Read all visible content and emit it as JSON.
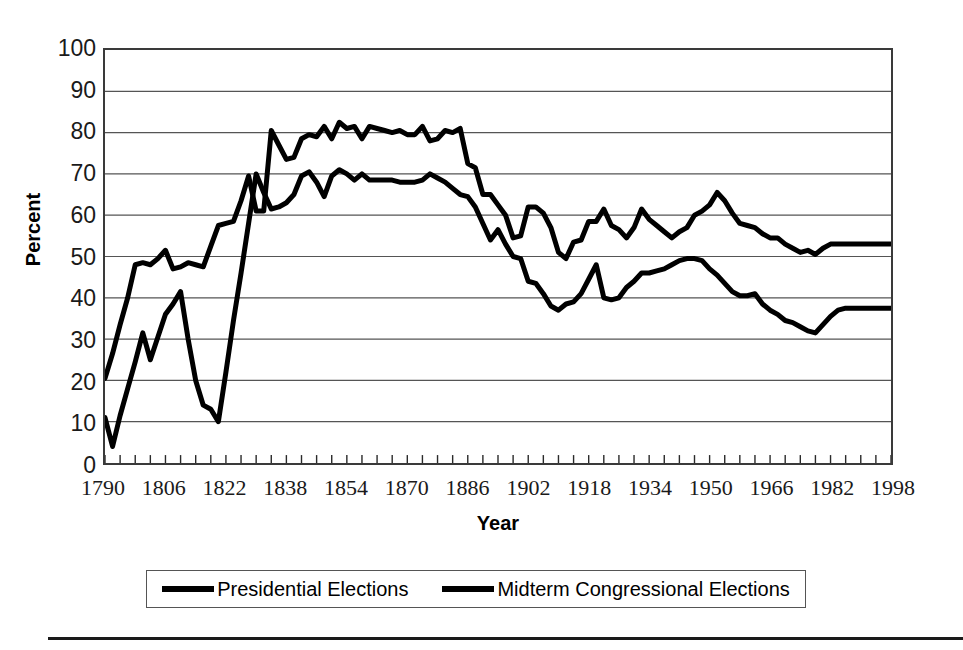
{
  "chart_data": {
    "type": "line",
    "title": "",
    "xlabel": "Year",
    "ylabel": "Percent",
    "xlim": [
      1790,
      1998
    ],
    "ylim": [
      0,
      100
    ],
    "grid": "horizontal",
    "legend_position": "bottom",
    "x_tick_labels": [
      "1790",
      "1806",
      "1822",
      "1838",
      "1854",
      "1870",
      "1886",
      "1902",
      "1918",
      "1934",
      "1950",
      "1966",
      "1982",
      "1998"
    ],
    "x_tick_values": [
      1790,
      1806,
      1822,
      1838,
      1854,
      1870,
      1886,
      1902,
      1918,
      1934,
      1950,
      1966,
      1982,
      1998
    ],
    "x_minor_tick_interval": 4,
    "y_tick_labels": [
      "100",
      "90",
      "80",
      "70",
      "60",
      "50",
      "40",
      "30",
      "20",
      "10",
      "0"
    ],
    "y_tick_values": [
      100,
      90,
      80,
      70,
      60,
      50,
      40,
      30,
      20,
      10,
      0
    ],
    "series": [
      {
        "name": "Presidential Elections",
        "color": "#000000",
        "x": [
          1790,
          1792,
          1794,
          1796,
          1798,
          1800,
          1802,
          1804,
          1806,
          1808,
          1810,
          1812,
          1814,
          1816,
          1818,
          1820,
          1822,
          1824,
          1826,
          1828,
          1830,
          1832,
          1834,
          1836,
          1838,
          1840,
          1842,
          1844,
          1846,
          1848,
          1850,
          1852,
          1854,
          1856,
          1858,
          1860,
          1862,
          1864,
          1866,
          1868,
          1870,
          1872,
          1874,
          1876,
          1878,
          1880,
          1882,
          1884,
          1886,
          1888,
          1890,
          1892,
          1894,
          1896,
          1898,
          1900,
          1902,
          1904,
          1906,
          1908,
          1910,
          1912,
          1914,
          1916,
          1918,
          1920,
          1922,
          1924,
          1926,
          1928,
          1930,
          1932,
          1934,
          1936,
          1938,
          1940,
          1942,
          1944,
          1946,
          1948,
          1950,
          1952,
          1954,
          1956,
          1958,
          1960,
          1962,
          1964,
          1966,
          1968,
          1970,
          1972,
          1974,
          1976,
          1978,
          1980,
          1982,
          1984,
          1986,
          1988,
          1990,
          1992,
          1994,
          1996,
          1998
        ],
        "y": [
          20.5,
          26.5,
          33.5,
          40.0,
          48.0,
          48.5,
          48.0,
          49.5,
          51.5,
          47.0,
          47.5,
          48.5,
          48.0,
          47.5,
          52.5,
          57.5,
          58.0,
          58.5,
          63.5,
          69.5,
          61.0,
          61.0,
          80.5,
          77.0,
          73.5,
          74.0,
          78.5,
          79.5,
          79.0,
          81.5,
          78.5,
          82.5,
          81.0,
          81.5,
          78.5,
          81.5,
          81.0,
          80.5,
          80.0,
          80.5,
          79.5,
          79.5,
          81.5,
          78.0,
          78.5,
          80.5,
          80.0,
          81.0,
          72.5,
          71.5,
          65.0,
          65.0,
          62.5,
          60.0,
          54.5,
          55.0,
          62.0,
          62.0,
          60.5,
          57.0,
          51.0,
          49.5,
          53.5,
          54.0,
          58.5,
          58.5,
          61.5,
          57.5,
          56.5,
          54.5,
          57.0,
          61.5,
          59.0,
          57.5,
          56.0,
          54.5,
          56.0,
          57.0,
          60.0,
          61.0,
          62.5,
          65.5,
          63.5,
          60.5,
          58.0,
          57.5,
          57.0,
          55.5,
          54.5,
          54.5,
          53.0,
          52.0,
          51.0,
          51.5,
          50.5,
          52.0,
          53.0,
          53.0,
          53.0,
          53.0,
          53.0,
          53.0,
          53.0,
          53.0,
          53.0
        ]
      },
      {
        "name": "Midterm Congressional Elections",
        "color": "#000000",
        "x": [
          1790,
          1792,
          1794,
          1796,
          1798,
          1800,
          1802,
          1804,
          1806,
          1808,
          1810,
          1812,
          1814,
          1816,
          1818,
          1820,
          1822,
          1824,
          1826,
          1828,
          1830,
          1832,
          1834,
          1836,
          1838,
          1840,
          1842,
          1844,
          1846,
          1848,
          1850,
          1852,
          1854,
          1856,
          1858,
          1860,
          1862,
          1864,
          1866,
          1868,
          1870,
          1872,
          1874,
          1876,
          1878,
          1880,
          1882,
          1884,
          1886,
          1888,
          1890,
          1892,
          1894,
          1896,
          1898,
          1900,
          1902,
          1904,
          1906,
          1908,
          1910,
          1912,
          1914,
          1916,
          1918,
          1920,
          1922,
          1924,
          1926,
          1928,
          1930,
          1932,
          1934,
          1936,
          1938,
          1940,
          1942,
          1944,
          1946,
          1948,
          1950,
          1952,
          1954,
          1956,
          1958,
          1960,
          1962,
          1964,
          1966,
          1968,
          1970,
          1972,
          1974,
          1976,
          1978,
          1980,
          1982,
          1984,
          1986,
          1988,
          1990,
          1992,
          1994,
          1996,
          1998
        ],
        "y": [
          11.0,
          4.0,
          11.5,
          18.0,
          24.5,
          31.5,
          25.0,
          30.5,
          36.0,
          38.5,
          41.5,
          30.0,
          20.0,
          14.0,
          13.0,
          10.0,
          22.0,
          34.5,
          46.0,
          58.0,
          70.0,
          65.5,
          61.5,
          62.0,
          63.0,
          65.0,
          69.5,
          70.5,
          68.0,
          64.5,
          69.5,
          71.0,
          70.0,
          68.5,
          70.0,
          68.5,
          68.5,
          68.5,
          68.5,
          68.0,
          68.0,
          68.0,
          68.5,
          70.0,
          69.0,
          68.0,
          66.5,
          65.0,
          64.5,
          62.0,
          58.0,
          54.0,
          56.5,
          53.0,
          50.0,
          49.5,
          44.0,
          43.5,
          41.0,
          38.0,
          37.0,
          38.5,
          39.0,
          41.0,
          44.5,
          48.0,
          40.0,
          39.5,
          40.0,
          42.5,
          44.0,
          46.0,
          46.0,
          46.5,
          47.0,
          48.0,
          49.0,
          49.5,
          49.5,
          49.0,
          47.0,
          45.5,
          43.5,
          41.5,
          40.5,
          40.5,
          41.0,
          38.5,
          37.0,
          36.0,
          34.5,
          34.0,
          33.0,
          32.0,
          31.5,
          33.5,
          35.5,
          37.0,
          37.5,
          37.5,
          37.5,
          37.5,
          37.5,
          37.5,
          37.5
        ]
      }
    ]
  },
  "axes": {
    "y_title": "Percent",
    "x_title": "Year"
  },
  "legend": {
    "entries": [
      {
        "label": "Presidential Elections",
        "swatch": "line-swatch"
      },
      {
        "label": "Midterm Congressional Elections",
        "swatch": "line-swatch"
      }
    ]
  },
  "colors": {
    "series": "#000000",
    "grid": "#555555",
    "frame": "#3a3a3a"
  }
}
